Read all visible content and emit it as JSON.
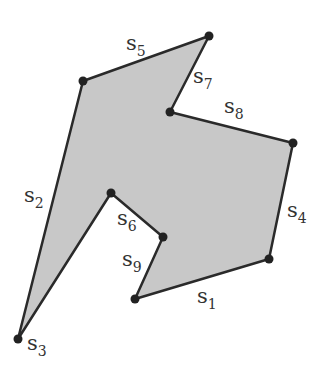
{
  "diagram": {
    "fill_color": "#c8c8c8",
    "stroke_color": "#2a2a2a",
    "vertex_color": "#222222",
    "vertices": [
      {
        "x": 135,
        "y": 299
      },
      {
        "x": 269,
        "y": 259
      },
      {
        "x": 293,
        "y": 143
      },
      {
        "x": 170,
        "y": 112
      },
      {
        "x": 209,
        "y": 36
      },
      {
        "x": 83,
        "y": 81
      },
      {
        "x": 18,
        "y": 339
      },
      {
        "x": 111,
        "y": 193
      },
      {
        "x": 163,
        "y": 237
      }
    ],
    "labels": [
      {
        "base": "s",
        "sub": "1",
        "x": 197,
        "y": 303
      },
      {
        "base": "s",
        "sub": "2",
        "x": 24,
        "y": 202
      },
      {
        "base": "s",
        "sub": "3",
        "x": 27,
        "y": 350
      },
      {
        "base": "s",
        "sub": "4",
        "x": 287,
        "y": 217
      },
      {
        "base": "s",
        "sub": "5",
        "x": 126,
        "y": 50
      },
      {
        "base": "s",
        "sub": "6",
        "x": 117,
        "y": 225
      },
      {
        "base": "s",
        "sub": "7",
        "x": 193,
        "y": 83
      },
      {
        "base": "s",
        "sub": "8",
        "x": 224,
        "y": 113
      },
      {
        "base": "s",
        "sub": "9",
        "x": 122,
        "y": 266
      }
    ]
  }
}
